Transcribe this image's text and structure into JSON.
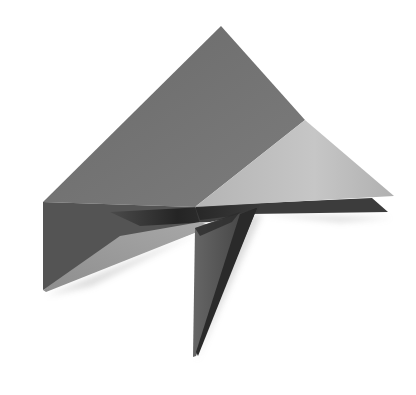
{
  "image": {
    "subject": "folded paper origami shape",
    "background": "#ffffff",
    "colors": {
      "main_face": "#6f6f6f",
      "main_face_light": "#7a7a7a",
      "light_flap": "#bdbdbd",
      "light_flap_edge": "#d2d2d2",
      "dark_fold": "#3a3a3a",
      "darkest_crease": "#222222",
      "lower_left_dark": "#525252",
      "lower_left_light": "#9a9a9a",
      "tail": "#5a5a5a",
      "tail_dark": "#2e2e2e",
      "shadow": "#e6e6e6"
    }
  }
}
